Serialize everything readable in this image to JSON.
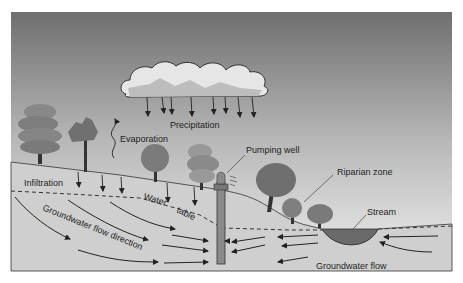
{
  "diagram": {
    "labels": {
      "precipitation": "Precipitation",
      "evaporation": "Evaporation",
      "infiltration": "Infiltration",
      "water": "Water",
      "table": "table",
      "groundwater_flow_direction": "Groundwater flow direction",
      "pumping_well": "Pumping well",
      "riparian_zone": "Riparian zone",
      "stream": "Stream",
      "groundwater_flow": "Groundwater flow"
    },
    "colors": {
      "sky_top": "#6e6e6e",
      "sky_bottom": "#ececec",
      "ground": "#cfcfcf",
      "stream": "#6a6a6a",
      "tree": "#7a7a7a",
      "line": "#2a2a2a"
    }
  }
}
